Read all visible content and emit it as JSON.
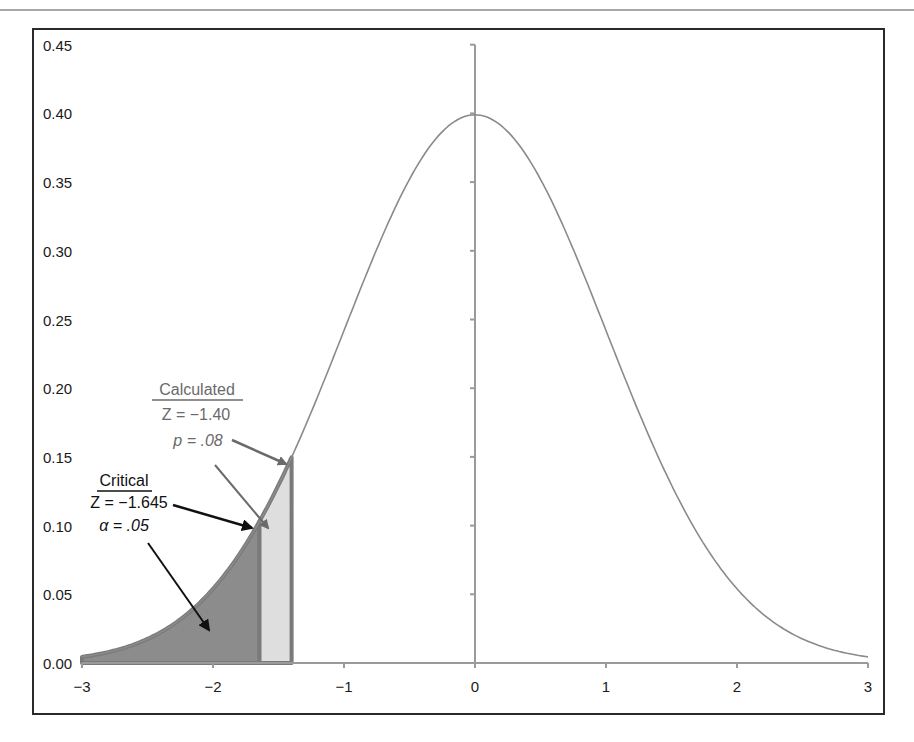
{
  "chart_data": {
    "type": "area",
    "title": "",
    "xlabel": "",
    "ylabel": "",
    "xlim": [
      -3,
      3
    ],
    "ylim": [
      0,
      0.45
    ],
    "grid": false,
    "legend": null,
    "x_ticks": [
      "-3",
      "-2",
      "-1",
      "0",
      "1",
      "2",
      "3"
    ],
    "y_ticks": [
      "0.00",
      "0.05",
      "0.10",
      "0.15",
      "0.20",
      "0.25",
      "0.30",
      "0.35",
      "0.40",
      "0.45"
    ],
    "x_tick_labels": [
      "−3",
      "−2",
      "−1",
      "0",
      "1",
      "2",
      "3"
    ],
    "series": [
      {
        "name": "Standard normal density",
        "type": "line",
        "x": [
          -3.0,
          -2.5,
          -2.0,
          -1.645,
          -1.5,
          -1.4,
          -1.0,
          -0.5,
          0.0,
          0.5,
          1.0,
          1.5,
          2.0,
          2.5,
          3.0
        ],
        "values": [
          0.0044,
          0.0175,
          0.054,
          0.1031,
          0.1295,
          0.1497,
          0.242,
          0.3521,
          0.3989,
          0.3521,
          0.242,
          0.1295,
          0.054,
          0.0175,
          0.0044
        ],
        "color": "#8a8a8a"
      },
      {
        "name": "Critical region (alpha)",
        "type": "area",
        "from": -3.0,
        "to": -1.645,
        "color": "#8c8c8c",
        "outline": "#7a7a7a"
      },
      {
        "name": "Calculated p region",
        "type": "area",
        "from": -1.645,
        "to": -1.4,
        "color": "#dedede",
        "outline": "#7a7a7a"
      }
    ],
    "annotations": [
      {
        "id": "calculated",
        "heading": "Calculated",
        "line1": "Z = −1.40",
        "line2": "p = .08",
        "color": "#6a6a6a"
      },
      {
        "id": "critical",
        "heading": "Critical",
        "line1": "Z = −1.645",
        "line2": "α = .05",
        "color": "#111111"
      }
    ]
  },
  "labels": {
    "calculated_heading": "Calculated",
    "calculated_z": "Z = −1.40",
    "calculated_p": "p = .08",
    "critical_heading": "Critical",
    "critical_z": "Z = −1.645",
    "critical_alpha": "α = .05"
  }
}
